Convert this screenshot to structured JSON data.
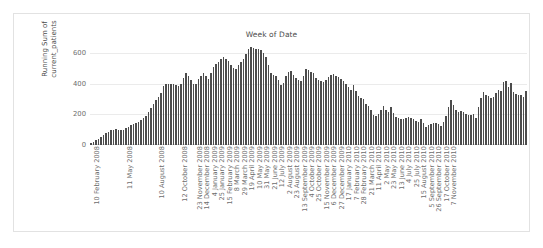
{
  "chart_data": {
    "type": "bar",
    "title": "Week of Date",
    "xlabel": "",
    "ylabel": "Running Sum of\ncurrent_patients",
    "ylim": [
      0,
      660
    ],
    "yticks": [
      0,
      200,
      400,
      600
    ],
    "ytick_labels": [
      "0",
      "200",
      "400",
      "600"
    ],
    "grid": true,
    "legend": null,
    "bar_color": "#4c4c4c",
    "axis_label_color": "#6d6d6d",
    "gridline_color": "#ebebeb",
    "background_color": "#ffffff",
    "xtick_labels": [
      "10 February 2008",
      "11 May 2008",
      "10 August 2008",
      "12 October 2008",
      "23 November 2008",
      "14 December 2008",
      "4 January 2009",
      "25 January 2009",
      "15 February 2009",
      "8 March 2009",
      "29 March 2009",
      "19 April 2009",
      "10 May 2009",
      "31 May 2009",
      "21 June 2009",
      "12 July 2009",
      "2 August 2009",
      "23 August 2009",
      "13 September 2009",
      "4 October 2009",
      "25 October 2009",
      "15 November 2009",
      "6 December 2009",
      "27 December 2009",
      "17 January 2010",
      "7 February 2010",
      "28 February 2010",
      "21 March 2010",
      "11 April 2010",
      "2 May 2010",
      "23 May 2010",
      "13 June 2010",
      "4 July 2010",
      "25 July 2010",
      "15 August 2010",
      "5 September 2010",
      "26 September 2010",
      "17 October 2010",
      "7 November 2010"
    ],
    "xtick_indices": [
      0,
      13,
      26,
      35,
      41,
      44,
      47,
      50,
      53,
      56,
      59,
      62,
      65,
      68,
      71,
      74,
      77,
      80,
      83,
      86,
      89,
      92,
      95,
      98,
      101,
      104,
      107,
      110,
      113,
      116,
      119,
      122,
      125,
      128,
      131,
      134,
      137,
      140,
      143
    ],
    "values": [
      10,
      18,
      30,
      42,
      55,
      68,
      78,
      88,
      96,
      100,
      102,
      100,
      100,
      101,
      110,
      120,
      128,
      140,
      145,
      152,
      162,
      175,
      192,
      214,
      240,
      268,
      292,
      314,
      340,
      386,
      398,
      400,
      398,
      396,
      392,
      388,
      400,
      440,
      472,
      450,
      424,
      396,
      400,
      430,
      452,
      470,
      448,
      432,
      470,
      508,
      530,
      544,
      560,
      574,
      560,
      552,
      520,
      504,
      496,
      520,
      540,
      560,
      596,
      628,
      640,
      632,
      628,
      630,
      624,
      602,
      572,
      520,
      472,
      460,
      452,
      424,
      392,
      404,
      448,
      478,
      484,
      460,
      440,
      422,
      416,
      450,
      500,
      490,
      476,
      468,
      440,
      422,
      420,
      412,
      424,
      442,
      460,
      466,
      448,
      444,
      432,
      416,
      398,
      380,
      360,
      392,
      352,
      318,
      310,
      300,
      268,
      252,
      232,
      196,
      190,
      204,
      228,
      256,
      226,
      216,
      248,
      208,
      186,
      176,
      168,
      170,
      176,
      180,
      176,
      168,
      160,
      152,
      168,
      142,
      120,
      128,
      140,
      146,
      144,
      140,
      126,
      150,
      190,
      248,
      292,
      262,
      232,
      218,
      224,
      216,
      200,
      198,
      196,
      204,
      176,
      246,
      310,
      346,
      330,
      318,
      308,
      316,
      340,
      360,
      352,
      412,
      418,
      380,
      404,
      348,
      334,
      330,
      326,
      316,
      350
    ]
  }
}
